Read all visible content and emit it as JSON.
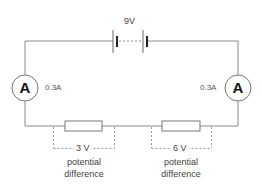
{
  "diagram": {
    "type": "series-circuit",
    "battery": {
      "label": "9V"
    },
    "ammeters": [
      {
        "symbol": "A",
        "reading": "0.3A",
        "position": "left"
      },
      {
        "symbol": "A",
        "reading": "0.3A",
        "position": "right"
      }
    ],
    "resistors": [
      {
        "voltage": "3 V",
        "caption_line1": "potential",
        "caption_line2": "difference"
      },
      {
        "voltage": "6 V",
        "caption_line1": "potential",
        "caption_line2": "difference"
      }
    ],
    "colors": {
      "wire": "#888888",
      "text": "#444444",
      "symbol": "#111111"
    }
  }
}
